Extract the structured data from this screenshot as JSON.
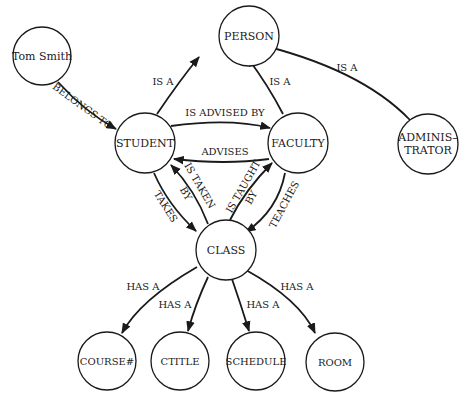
{
  "diagram": {
    "type": "semantic-network",
    "nodes": {
      "person": "PERSON",
      "tom_smith": "Tom Smith",
      "student": "STUDENT",
      "faculty": "FACULTY",
      "administrator_line1": "ADMINIS–",
      "administrator_line2": "TRATOR",
      "class": "CLASS",
      "course_num": "COURSE#",
      "ctitle": "CTITLE",
      "schedule": "SCHEDULE",
      "room": "ROOM"
    },
    "edges": {
      "tom_belongs_to_student": "BELONGS TO",
      "student_is_a_person": "IS A",
      "faculty_is_a_person": "IS A",
      "admin_is_a_person": "IS A",
      "student_is_advised_by_faculty": "IS ADVISED BY",
      "faculty_advises_student": "ADVISES",
      "student_takes_class": "TAKES",
      "class_is_taken_by_student_line1": "IS TAKEN",
      "class_is_taken_by_student_line2": "BY",
      "class_is_taught_by_faculty_line1": "IS TAUGHT",
      "class_is_taught_by_faculty_line2": "BY",
      "faculty_teaches_class": "TEACHES",
      "class_has_course_num": "HAS A",
      "class_has_ctitle": "HAS A",
      "class_has_schedule": "HAS A",
      "class_has_room": "HAS A"
    },
    "relations": [
      {
        "from": "Tom Smith",
        "to": "STUDENT",
        "label": "BELONGS TO"
      },
      {
        "from": "STUDENT",
        "to": "PERSON",
        "label": "IS A"
      },
      {
        "from": "FACULTY",
        "to": "PERSON",
        "label": "IS A"
      },
      {
        "from": "ADMINISTRATOR",
        "to": "PERSON",
        "label": "IS A"
      },
      {
        "from": "STUDENT",
        "to": "FACULTY",
        "label": "IS ADVISED BY"
      },
      {
        "from": "FACULTY",
        "to": "STUDENT",
        "label": "ADVISES"
      },
      {
        "from": "STUDENT",
        "to": "CLASS",
        "label": "TAKES"
      },
      {
        "from": "CLASS",
        "to": "STUDENT",
        "label": "IS TAKEN BY"
      },
      {
        "from": "CLASS",
        "to": "FACULTY",
        "label": "IS TAUGHT BY"
      },
      {
        "from": "FACULTY",
        "to": "CLASS",
        "label": "TEACHES"
      },
      {
        "from": "CLASS",
        "to": "COURSE#",
        "label": "HAS A"
      },
      {
        "from": "CLASS",
        "to": "CTITLE",
        "label": "HAS A"
      },
      {
        "from": "CLASS",
        "to": "SCHEDULE",
        "label": "HAS A"
      },
      {
        "from": "CLASS",
        "to": "ROOM",
        "label": "HAS A"
      }
    ],
    "colors": {
      "stroke": "#1a1a1a",
      "background": "#ffffff"
    }
  }
}
